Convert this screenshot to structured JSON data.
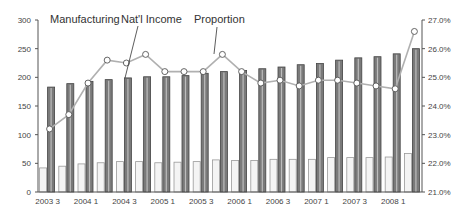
{
  "chart_data": {
    "type": "bar",
    "title": "",
    "xlabel": "",
    "ylabel": "",
    "ylabel_right": "",
    "grid": false,
    "legend_position": "annotations-top",
    "categories": [
      "2003 3",
      "2003 4",
      "2004 1",
      "2004 2",
      "2004 3",
      "2004 4",
      "2005 1",
      "2005 2",
      "2005 3",
      "2005 4",
      "2006 1",
      "2006 2",
      "2006 3",
      "2006 4",
      "2007 1",
      "2007 2",
      "2007 3",
      "2007 4",
      "2008 1",
      "2008 2"
    ],
    "x_tick_labels": [
      "2003 3",
      "2004 1",
      "2004 3",
      "2005 1",
      "2005 3",
      "2006 1",
      "2006 3",
      "2007 1",
      "2007 3",
      "2008 1"
    ],
    "ylim": [
      0,
      300
    ],
    "y_ticks": [
      "0",
      "50",
      "100",
      "150",
      "200",
      "250",
      "300"
    ],
    "ylim_right": [
      21.0,
      27.0
    ],
    "y_ticks_right": [
      "21.0%",
      "22.0%",
      "23.0%",
      "24.0%",
      "25.0%",
      "26.0%",
      "27.0%"
    ],
    "series": [
      {
        "name": "Manufacturing",
        "type": "bar",
        "axis": "left",
        "color": "#dcdcdc",
        "values": [
          42,
          45,
          49,
          51,
          53,
          53,
          51,
          52,
          53,
          56,
          55,
          55,
          57,
          57,
          57,
          60,
          60,
          60,
          61,
          67
        ]
      },
      {
        "name": "Nat'l Income",
        "type": "bar",
        "axis": "left",
        "color": "#666666",
        "values": [
          183,
          189,
          193,
          196,
          199,
          201,
          201,
          203,
          207,
          210,
          212,
          215,
          218,
          222,
          224,
          230,
          234,
          236,
          241,
          250
        ]
      },
      {
        "name": "Proportion",
        "type": "line",
        "axis": "right",
        "unit": "%",
        "color": "#aaaaaa",
        "values": [
          23.2,
          23.7,
          24.8,
          25.6,
          25.5,
          25.8,
          25.2,
          25.2,
          25.2,
          25.8,
          25.2,
          24.8,
          24.9,
          24.7,
          24.9,
          24.9,
          24.8,
          24.7,
          24.6,
          26.6
        ]
      }
    ],
    "annotations": [
      {
        "text": "Manufacturing"
      },
      {
        "text": "Nat'l Income"
      },
      {
        "text": "Proportion"
      }
    ]
  }
}
